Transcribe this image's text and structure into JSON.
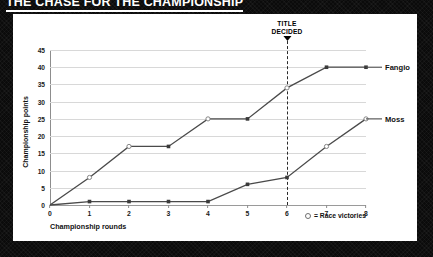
{
  "headline": "THE CHASE FOR THE CHAMPIONSHIP",
  "annotation": {
    "title_decided_line1": "TITLE",
    "title_decided_line2": "DECIDED",
    "at_round": 6
  },
  "legend": {
    "marker_icon": "open-circle-icon",
    "text": "= Race victories"
  },
  "colors": {
    "background": "#0b0b0b",
    "panel": "#ffffff",
    "line": "#4a4a4a",
    "grid": "#d8d8d8",
    "axis": "#8d8d8d",
    "text": "#111111"
  },
  "chart_data": {
    "type": "line",
    "title": "THE CHASE FOR THE CHAMPIONSHIP",
    "xlabel": "Championship rounds",
    "ylabel": "Championship points",
    "x": [
      0,
      1,
      2,
      3,
      4,
      5,
      6,
      7,
      8
    ],
    "xlim": [
      0,
      8
    ],
    "ylim": [
      0,
      45
    ],
    "yticks": [
      0,
      5,
      10,
      15,
      20,
      25,
      30,
      35,
      40,
      45
    ],
    "xticks": [
      0,
      1,
      2,
      3,
      4,
      5,
      6,
      7,
      8
    ],
    "grid": true,
    "legend_position": "right-of-axes-inline-labels",
    "series": [
      {
        "name": "Fangio",
        "values": [
          0,
          8,
          17,
          17,
          25,
          25,
          34,
          40,
          40
        ],
        "victories": [
          false,
          true,
          true,
          false,
          true,
          false,
          true,
          false,
          false
        ]
      },
      {
        "name": "Moss",
        "values": [
          0,
          1,
          1,
          1,
          1,
          6,
          8,
          17,
          25
        ],
        "victories": [
          false,
          false,
          false,
          false,
          false,
          false,
          false,
          true,
          true
        ]
      }
    ]
  }
}
